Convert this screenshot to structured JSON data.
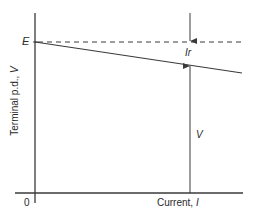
{
  "diagram": {
    "type": "graph-diagram",
    "axes": {
      "y_label_text": "Terminal p.d., ",
      "y_label_symbol": "V",
      "x_label_text": "Current, ",
      "x_label_symbol": "I",
      "origin_label": "0"
    },
    "annotations": {
      "emf_label": "E",
      "drop_label": "Ir",
      "terminal_label": "V"
    },
    "lines": {
      "emf_dashed": {
        "from": [
          35,
          42
        ],
        "to": [
          242,
          42
        ],
        "style": "dashed"
      },
      "terminal_pd_solid": {
        "from": [
          35,
          42
        ],
        "to": [
          242,
          73
        ],
        "style": "solid"
      },
      "measure_line_x": 190
    },
    "colors": {
      "line": "#3a3a3a",
      "text": "#2a2a2a",
      "background": "#ffffff"
    }
  }
}
